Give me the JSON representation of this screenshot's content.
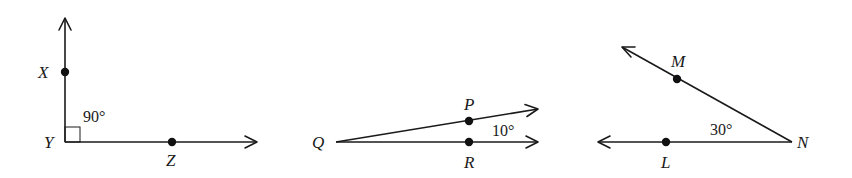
{
  "diagram": {
    "type": "geometry-angles",
    "stroke_color": "#1a1a1a",
    "background": "#ffffff",
    "figures": [
      {
        "id": "angle-XYZ",
        "vertex": "Y",
        "measure": "90°",
        "right_angle_marker": true,
        "points": {
          "X": "X",
          "Y": "Y",
          "Z": "Z"
        }
      },
      {
        "id": "angle-PQR",
        "vertex": "Q",
        "measure": "10°",
        "right_angle_marker": false,
        "points": {
          "P": "P",
          "Q": "Q",
          "R": "R"
        }
      },
      {
        "id": "angle-MNL",
        "vertex": "N",
        "measure": "30°",
        "right_angle_marker": false,
        "points": {
          "M": "M",
          "N": "N",
          "L": "L"
        }
      }
    ]
  }
}
